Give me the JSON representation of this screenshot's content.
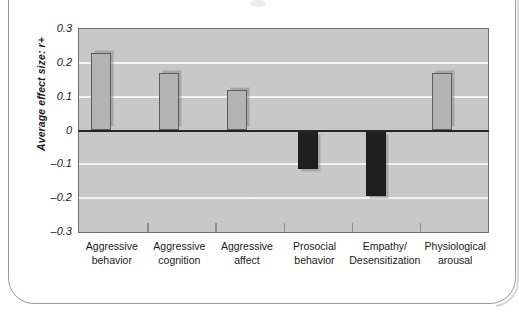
{
  "figure": {
    "frame_color": "#9a9a9a",
    "background": "#ffffff"
  },
  "chart_data": {
    "type": "bar",
    "title": "",
    "xlabel": "",
    "ylabel": "Average effect size: r+",
    "ylim": [
      -0.3,
      0.3
    ],
    "ytick_labels": [
      "0.3",
      "0.2",
      "0.1",
      "0",
      "–0.1",
      "–0.2",
      "–0.3"
    ],
    "ytick_values": [
      0.3,
      0.2,
      0.1,
      0,
      -0.1,
      -0.2,
      -0.3
    ],
    "grid": true,
    "legend": "none",
    "categories": [
      "Aggressive behavior",
      "Aggressive cognition",
      "Aggressive affect",
      "Prosocial behavior",
      "Empathy/ Desensitization",
      "Physiological arousal"
    ],
    "category_lines": [
      [
        "Aggressive",
        "behavior"
      ],
      [
        "Aggressive",
        "cognition"
      ],
      [
        "Aggressive",
        "affect"
      ],
      [
        "Prosocial",
        "behavior"
      ],
      [
        "Empathy/",
        "Desensitization"
      ],
      [
        "Physiological",
        "arousal"
      ]
    ],
    "values": [
      0.23,
      0.17,
      0.12,
      -0.115,
      -0.195,
      0.17
    ],
    "bar_colors": [
      "#b4b4b4",
      "#b4b4b4",
      "#b4b4b4",
      "#1f1f1f",
      "#1f1f1f",
      "#b4b4b4"
    ],
    "positive_bar_color": "#b4b4b4",
    "negative_bar_color": "#1f1f1f",
    "plot_background": "#c9c9c9",
    "gridline_color": "#f2f2f2",
    "zero_line_color": "#262626"
  }
}
